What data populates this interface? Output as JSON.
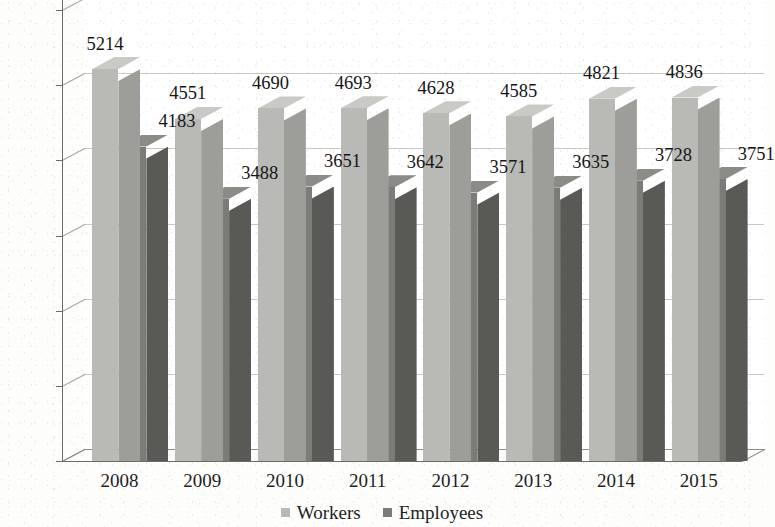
{
  "chart_data": {
    "type": "bar",
    "title": "",
    "subtitle": "",
    "xlabel": "",
    "ylabel": "",
    "categories": [
      "2008",
      "2009",
      "2010",
      "2011",
      "2012",
      "2013",
      "2014",
      "2015"
    ],
    "series": [
      {
        "name": "Workers",
        "color": "#b9b9b6",
        "side_color": "#9d9d99",
        "values": [
          5214,
          4551,
          4690,
          4693,
          4628,
          4585,
          4821,
          4836
        ]
      },
      {
        "name": "Employees",
        "color": "#7b7b78",
        "side_color": "#595956",
        "values": [
          4183,
          3488,
          3651,
          3642,
          3571,
          3635,
          3728,
          3751
        ]
      }
    ],
    "ylim": [
      0,
      6000
    ],
    "ytick_step": 1000,
    "yticks": [
      "0",
      "1000",
      "2000",
      "3000",
      "4000",
      "5000",
      "6000"
    ],
    "grid": true,
    "legend_position": "bottom-center",
    "data_labels": true,
    "three_d": true
  },
  "legend": {
    "items": [
      {
        "label": "Workers",
        "swatch": "#b9b9b6"
      },
      {
        "label": "Employees",
        "swatch": "#7b7b78"
      }
    ]
  }
}
